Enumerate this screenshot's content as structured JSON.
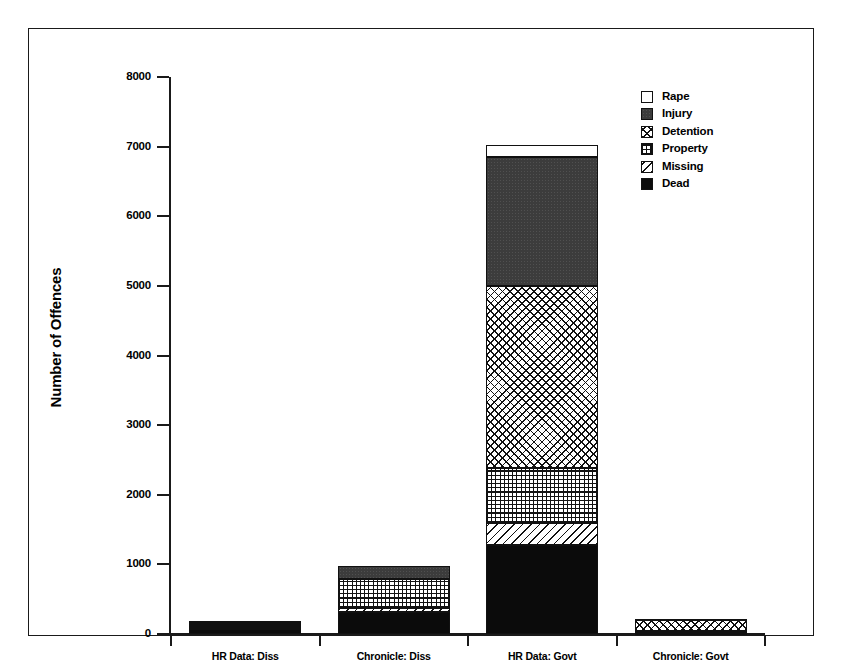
{
  "chart_data": {
    "type": "bar",
    "subtype": "stacked-bar",
    "title": "",
    "xlabel": "",
    "ylabel": "Number of Offences",
    "ylim": [
      0,
      8000
    ],
    "ytick_values": [
      0,
      1000,
      2000,
      3000,
      4000,
      5000,
      6000,
      7000,
      8000
    ],
    "ytick_labels": [
      "0",
      "1000",
      "2000",
      "3000",
      "4000",
      "5000",
      "6000",
      "7000",
      "8000"
    ],
    "grid": false,
    "legend_position": "top-right",
    "categories": [
      "HR Data: Diss",
      "Chronicle: Diss",
      "HR Data: Govt",
      "Chronicle: Govt"
    ],
    "series": [
      {
        "name": "Dead",
        "fill": "solid-black",
        "values": [
          75,
          320,
          1280,
          20
        ]
      },
      {
        "name": "Missing",
        "fill": "diagonal-line",
        "values": [
          20,
          50,
          320,
          10
        ]
      },
      {
        "name": "Property",
        "fill": "grid-hatch",
        "values": [
          55,
          420,
          780,
          10
        ]
      },
      {
        "name": "Detention",
        "fill": "x-hatch",
        "values": [
          10,
          0,
          2620,
          155
        ]
      },
      {
        "name": "Injury",
        "fill": "dark-gray",
        "values": [
          20,
          185,
          1850,
          20
        ]
      },
      {
        "name": "Rape",
        "fill": "white",
        "values": [
          0,
          0,
          180,
          0
        ]
      }
    ],
    "totals": [
      180,
      975,
      7030,
      215
    ],
    "legend_order_top_to_bottom": [
      "Rape",
      "Injury",
      "Detention",
      "Property",
      "Missing",
      "Dead"
    ],
    "colors": {
      "dark_gray": "#3c3c3c",
      "black": "#0b0b0b",
      "white": "#ffffff",
      "outline": "#111111",
      "frame": "#1a1a1a"
    }
  },
  "axes": {
    "y_title": "Number of Offences",
    "y_ticks": [
      {
        "label": "8000",
        "value": 8000
      },
      {
        "label": "7000",
        "value": 7000
      },
      {
        "label": "6000",
        "value": 6000
      },
      {
        "label": "5000",
        "value": 5000
      },
      {
        "label": "4000",
        "value": 4000
      },
      {
        "label": "3000",
        "value": 3000
      },
      {
        "label": "2000",
        "value": 2000
      },
      {
        "label": "1000",
        "value": 1000
      },
      {
        "label": "0",
        "value": 0
      }
    ],
    "x_ticks": [
      {
        "label": "HR Data: Diss"
      },
      {
        "label": "Chronicle: Diss"
      },
      {
        "label": "HR Data: Govt"
      },
      {
        "label": "Chronicle: Govt"
      }
    ]
  },
  "legend": {
    "items": [
      {
        "label": "Rape",
        "swatch": "swatch-white"
      },
      {
        "label": "Injury",
        "swatch": "swatch-dark-gray"
      },
      {
        "label": "Detention",
        "swatch": "swatch-x-hatch"
      },
      {
        "label": "Property",
        "swatch": "swatch-grid-hatch"
      },
      {
        "label": "Missing",
        "swatch": "swatch-diagonal-line"
      },
      {
        "label": "Dead",
        "swatch": "swatch-solid-black"
      }
    ]
  }
}
